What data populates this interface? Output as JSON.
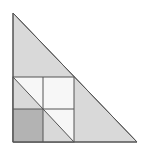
{
  "diagram": {
    "colors": {
      "background": "#ffffff",
      "triangle_fill": "#d9d9d9",
      "white_cell_fill": "#f7f7f7",
      "dark_cell_fill": "#b3b3b3",
      "stroke": "#555555"
    },
    "triangle": {
      "apex": [
        13,
        13
      ],
      "bottom_left": [
        13,
        142
      ],
      "bottom_right": [
        137,
        142
      ]
    },
    "square": {
      "x": 13,
      "y": 77,
      "width": 61,
      "height": 65
    },
    "midlines": {
      "vertical_x": 43,
      "horizontal_y": 109
    }
  }
}
